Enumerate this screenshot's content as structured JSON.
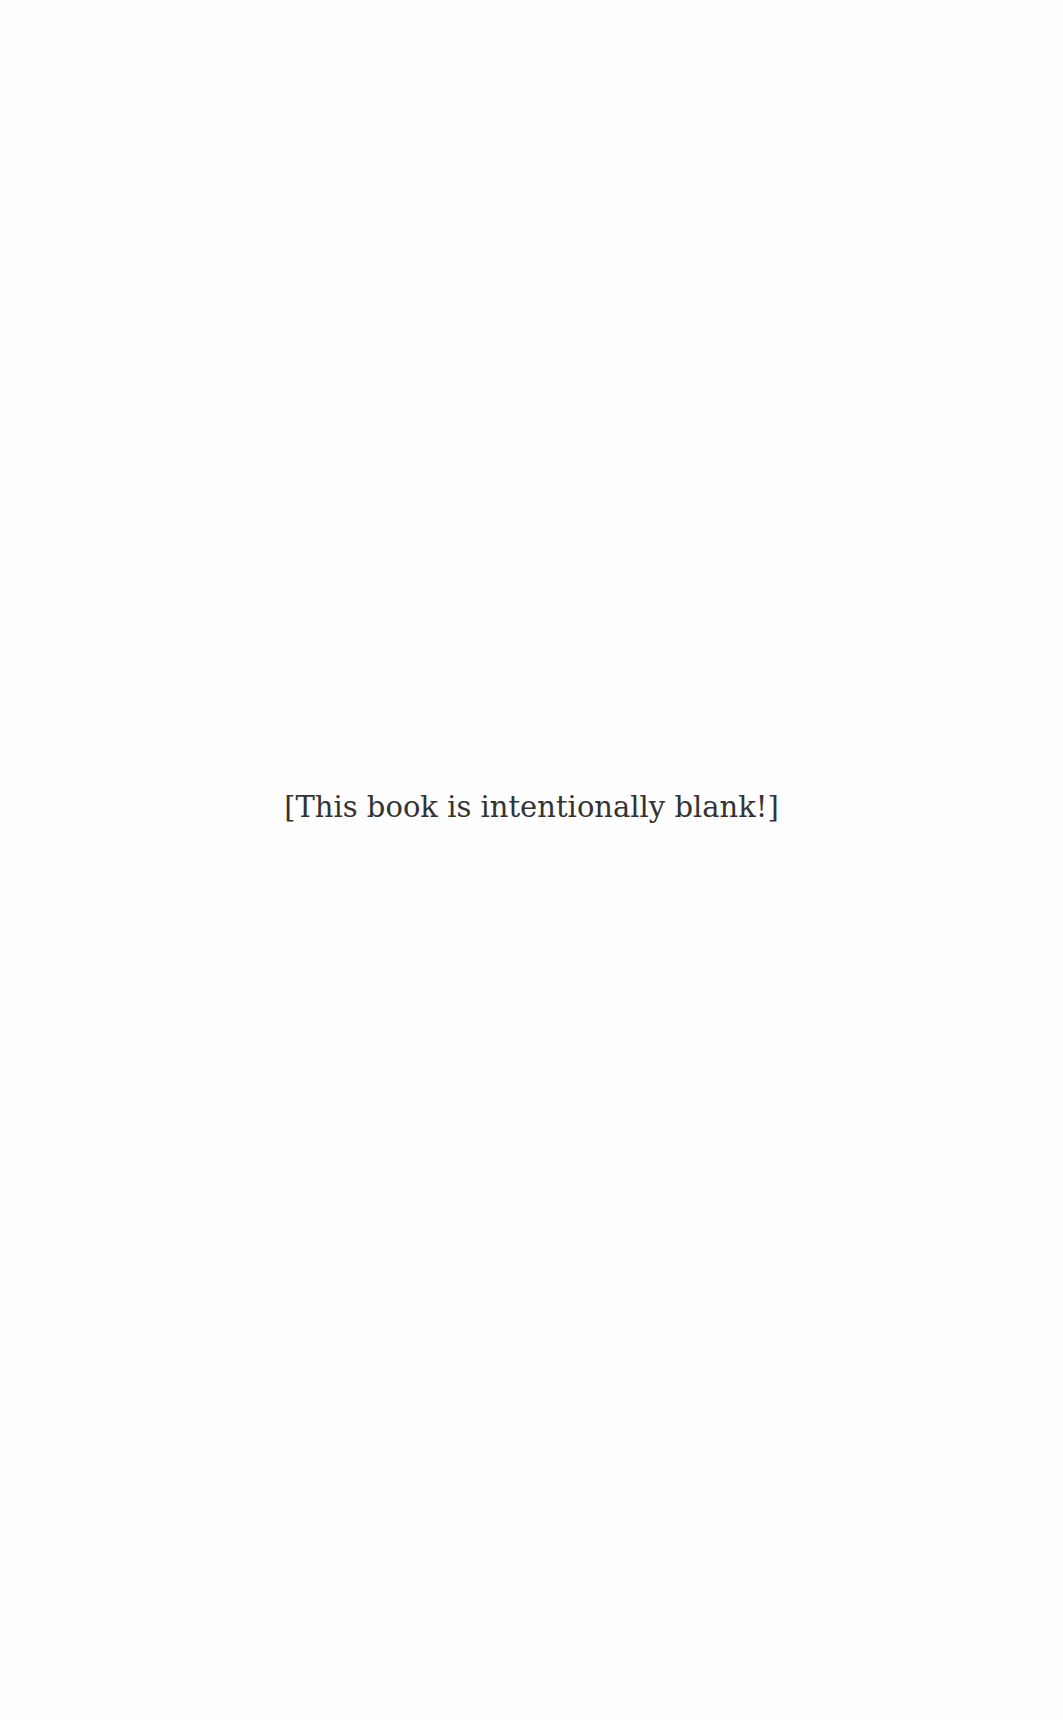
{
  "page": {
    "background_color": "#fefefe",
    "text_color": "#333333",
    "notice": "[This book is intentionally blank!]"
  }
}
